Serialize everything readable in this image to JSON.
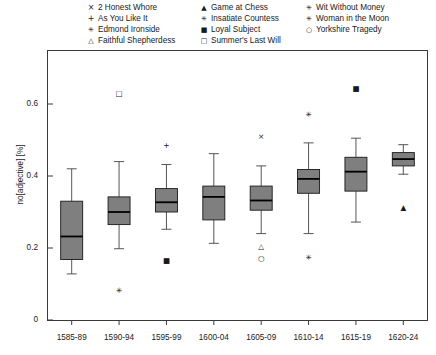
{
  "legend": {
    "columns": [
      {
        "entries": [
          {
            "marker": "×",
            "glyph_class": "",
            "icon": "cross-x-marker",
            "label": "2 Honest Whore"
          },
          {
            "marker": "+",
            "glyph_class": "",
            "icon": "plus-marker",
            "label": "As You Like It"
          },
          {
            "marker": "✳",
            "glyph_class": "sm",
            "icon": "asterisk-marker",
            "label": "Edmond Ironside"
          },
          {
            "marker": "△",
            "glyph_class": "sm",
            "icon": "triangle-outline-marker",
            "label": "Faithful Shepherdess"
          }
        ]
      },
      {
        "entries": [
          {
            "marker": "▲",
            "glyph_class": "sm",
            "icon": "triangle-filled-marker",
            "label": "Game at Chess"
          },
          {
            "marker": "✳",
            "glyph_class": "sm",
            "icon": "asterisk-marker",
            "label": "Insatiate Countess"
          },
          {
            "marker": "■",
            "glyph_class": "sm",
            "icon": "square-filled-marker",
            "label": "Loyal Subject"
          },
          {
            "marker": "□",
            "glyph_class": "sm",
            "icon": "square-outline-marker",
            "label": "Summer's Last Will"
          }
        ]
      },
      {
        "entries": [
          {
            "marker": "✳",
            "glyph_class": "sm",
            "icon": "asterisk-marker",
            "label": "Wit Without Money"
          },
          {
            "marker": "✳",
            "glyph_class": "sm",
            "icon": "asterisk-marker",
            "label": "Woman in the Moon"
          },
          {
            "marker": "○",
            "glyph_class": "sm",
            "icon": "circle-outline-marker",
            "label": "Yorkshire Tragedy"
          }
        ]
      }
    ]
  },
  "axes": {
    "ylabel": "no[adjective] [%]",
    "yticks": [
      "0",
      "0.2",
      "0.4",
      "0.6"
    ],
    "ytick_values": [
      0,
      0.2,
      0.4,
      0.6
    ],
    "ylim": [
      0,
      0.72
    ],
    "xticks": [
      "1585-89",
      "1590-94",
      "1595-99",
      "1600-04",
      "1605-09",
      "1610-14",
      "1615-19",
      "1620-24"
    ]
  },
  "style": {
    "box_fill": "#7f7f7f",
    "box_edge": "#1a1a1a",
    "frame_color": "#3a3a3a",
    "whisker_color": "#555555",
    "median_color": "#000000",
    "marker_color": "#1a1a1a"
  },
  "chart_data": {
    "type": "box",
    "title": "",
    "xlabel": "",
    "ylabel": "no[adjective] [%]",
    "ylim": [
      0,
      0.72
    ],
    "grid": false,
    "legend_position": "top",
    "categories": [
      "1585-89",
      "1590-94",
      "1595-99",
      "1600-04",
      "1605-09",
      "1610-14",
      "1615-19",
      "1620-24"
    ],
    "boxes": [
      {
        "category": "1585-89",
        "whisker_low": 0.128,
        "q1": 0.168,
        "median": 0.232,
        "q3": 0.33,
        "whisker_high": 0.42,
        "outliers": []
      },
      {
        "category": "1590-94",
        "whisker_low": 0.198,
        "q1": 0.265,
        "median": 0.3,
        "q3": 0.342,
        "whisker_high": 0.44,
        "outliers": [
          {
            "value": 0.63,
            "marker": "□",
            "icon": "square-outline-marker",
            "play": "Summer's Last Will"
          },
          {
            "value": 0.083,
            "marker": "✳",
            "icon": "asterisk-marker",
            "play": "Edmond Ironside"
          }
        ]
      },
      {
        "category": "1595-99",
        "whisker_low": 0.252,
        "q1": 0.3,
        "median": 0.327,
        "q3": 0.365,
        "whisker_high": 0.432,
        "outliers": [
          {
            "value": 0.487,
            "marker": "+",
            "icon": "plus-marker",
            "play": "As You Like It"
          },
          {
            "value": 0.167,
            "marker": "■",
            "icon": "square-filled-marker",
            "play": "Loyal Subject"
          }
        ]
      },
      {
        "category": "1600-04",
        "whisker_low": 0.213,
        "q1": 0.278,
        "median": 0.342,
        "q3": 0.372,
        "whisker_high": 0.462,
        "outliers": []
      },
      {
        "category": "1605-09",
        "whisker_low": 0.24,
        "q1": 0.305,
        "median": 0.332,
        "q3": 0.372,
        "whisker_high": 0.428,
        "outliers": [
          {
            "value": 0.51,
            "marker": "×",
            "icon": "cross-x-marker",
            "play": "2 Honest Whore"
          },
          {
            "value": 0.205,
            "marker": "△",
            "icon": "triangle-outline-marker",
            "play": "Faithful Shepherdess"
          },
          {
            "value": 0.172,
            "marker": "○",
            "icon": "circle-outline-marker",
            "play": "Yorkshire Tragedy"
          }
        ]
      },
      {
        "category": "1610-14",
        "whisker_low": 0.24,
        "q1": 0.352,
        "median": 0.392,
        "q3": 0.418,
        "whisker_high": 0.492,
        "outliers": [
          {
            "value": 0.572,
            "marker": "✳",
            "icon": "asterisk-marker",
            "play": "Wit Without Money"
          },
          {
            "value": 0.175,
            "marker": "✳",
            "icon": "asterisk-marker",
            "play": "Woman in the Moon"
          }
        ]
      },
      {
        "category": "1615-19",
        "whisker_low": 0.272,
        "q1": 0.358,
        "median": 0.412,
        "q3": 0.452,
        "whisker_high": 0.505,
        "outliers": [
          {
            "value": 0.645,
            "marker": "■",
            "icon": "square-filled-marker",
            "play": "Loyal Subject"
          }
        ]
      },
      {
        "category": "1620-24",
        "whisker_low": 0.405,
        "q1": 0.428,
        "median": 0.447,
        "q3": 0.465,
        "whisker_high": 0.487,
        "outliers": [
          {
            "value": 0.315,
            "marker": "▲",
            "icon": "triangle-filled-marker",
            "play": "Game at Chess"
          }
        ]
      }
    ]
  }
}
